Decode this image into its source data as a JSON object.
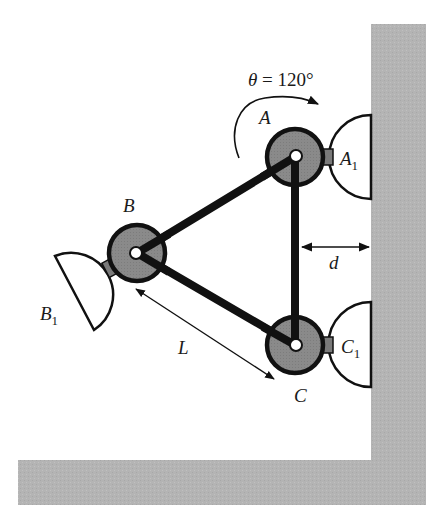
{
  "figure": {
    "colors": {
      "background": "#ffffff",
      "wall": "#b4b4b4",
      "hub_fill": "#8a8a8a",
      "outline": "#111111",
      "pad_fill": "#ffffff",
      "connector": "#7a7a7a"
    }
  },
  "labels": {
    "theta_symbol": "θ",
    "theta_eq": " = 120°",
    "node_a": "A",
    "node_b": "B",
    "node_c": "C",
    "pad_a_main": "A",
    "pad_a_sub": "1",
    "pad_b_main": "B",
    "pad_b_sub": "1",
    "pad_c_main": "C",
    "pad_c_sub": "1",
    "distance_d": "d",
    "length_l": "L"
  },
  "nodes": [
    {
      "id": "A",
      "x": 295,
      "y": 157
    },
    {
      "id": "B",
      "x": 137,
      "y": 253
    },
    {
      "id": "C",
      "x": 295,
      "y": 345
    }
  ],
  "links": [
    {
      "from": "A",
      "to": "B"
    },
    {
      "from": "B",
      "to": "C"
    },
    {
      "from": "A",
      "to": "C"
    }
  ],
  "dimensions": {
    "theta_deg": 120
  }
}
